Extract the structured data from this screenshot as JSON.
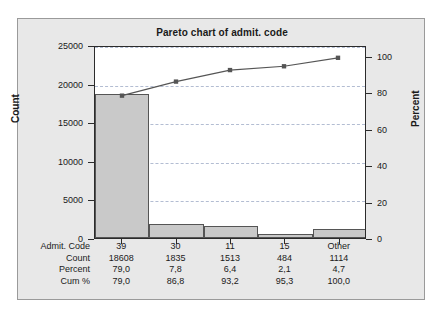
{
  "chart_data": {
    "type": "bar",
    "title": "Pareto chart of admit. code",
    "categories": [
      "39",
      "30",
      "11",
      "15",
      "Other"
    ],
    "values": [
      18608,
      1835,
      1513,
      484,
      1114
    ],
    "series": [
      {
        "name": "Count",
        "values": [
          18608,
          1835,
          1513,
          484,
          1114
        ]
      },
      {
        "name": "Cum %",
        "values": [
          79.0,
          86.8,
          93.2,
          95.3,
          100.0
        ]
      }
    ],
    "xlabel": "",
    "ylabel": "Count",
    "y2label": "Percent",
    "ylim": [
      0,
      25000
    ],
    "y2lim": [
      0,
      106
    ],
    "yticks": [
      0,
      5000,
      10000,
      15000,
      20000,
      25000
    ],
    "yticklabels": [
      "0",
      "5000",
      "10000",
      "15000",
      "20000",
      "25000"
    ],
    "y2ticks": [
      0,
      20,
      40,
      60,
      80,
      100
    ],
    "y2ticklabels": [
      "0",
      "20",
      "40",
      "60",
      "80",
      "100"
    ],
    "grid": true,
    "legend": "none",
    "bar_color": "#c9c9c9",
    "line_color": "#555555",
    "grid_color": "#9aa7c4"
  },
  "axes": {
    "left_title": "Count",
    "right_title": "Percent"
  },
  "table": {
    "rows": [
      {
        "label": "Admit. Code",
        "cells": [
          "39",
          "30",
          "11",
          "15",
          "Other"
        ]
      },
      {
        "label": "Count",
        "cells": [
          "18608",
          "1835",
          "1513",
          "484",
          "1114"
        ]
      },
      {
        "label": "Percent",
        "cells": [
          "79,0",
          "7,8",
          "6,4",
          "2,1",
          "4,7"
        ]
      },
      {
        "label": "Cum %",
        "cells": [
          "79,0",
          "86,8",
          "93,2",
          "95,3",
          "100,0"
        ]
      }
    ]
  }
}
